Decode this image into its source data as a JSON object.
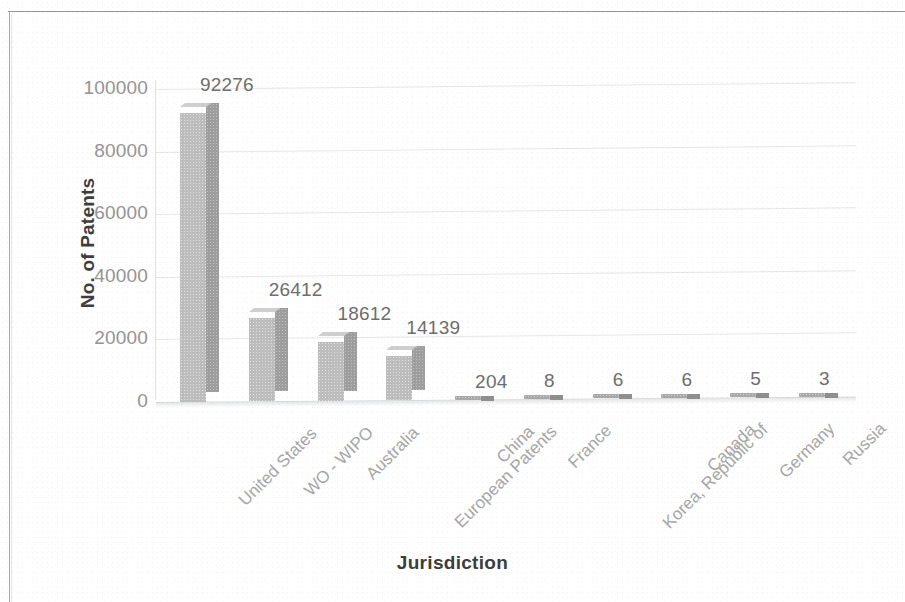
{
  "figure": {
    "frame_color": "#8d9196",
    "background": "#ffffff"
  },
  "chart_data": {
    "type": "bar",
    "title": "",
    "subtitle": "",
    "xlabel": "Jurisdiction",
    "ylabel": "No. of Patents",
    "categories": [
      "United States",
      "WO - WIPO",
      "Australia",
      "European Patents",
      "China",
      "France",
      "Korea, Republic of",
      "Canada",
      "Germany",
      "Russia"
    ],
    "values": [
      92276,
      26412,
      18612,
      14139,
      204,
      8,
      6,
      6,
      5,
      3
    ],
    "data_labels": [
      "92276",
      "26412",
      "18612",
      "14139",
      "204",
      "8",
      "6",
      "6",
      "5",
      "3"
    ],
    "ylim": [
      0,
      100000
    ],
    "yticks": [
      0,
      20000,
      40000,
      60000,
      80000,
      100000
    ],
    "ytick_labels": [
      "0",
      "20000",
      "40000",
      "60000",
      "80000",
      "100000"
    ],
    "grid": true,
    "grid_axis": "y",
    "legend": false,
    "legend_position": "none",
    "style": "3d-column",
    "bar_face_color": "#bdbdbd",
    "bar_side_color": "#9e9e9e",
    "bar_top_color": "#cfcfcf",
    "gridline_color": "#e6e7e9",
    "label_color": "#6e6e6e",
    "tick_color": "#949494",
    "axis_title_color": "#3d3d3d"
  }
}
